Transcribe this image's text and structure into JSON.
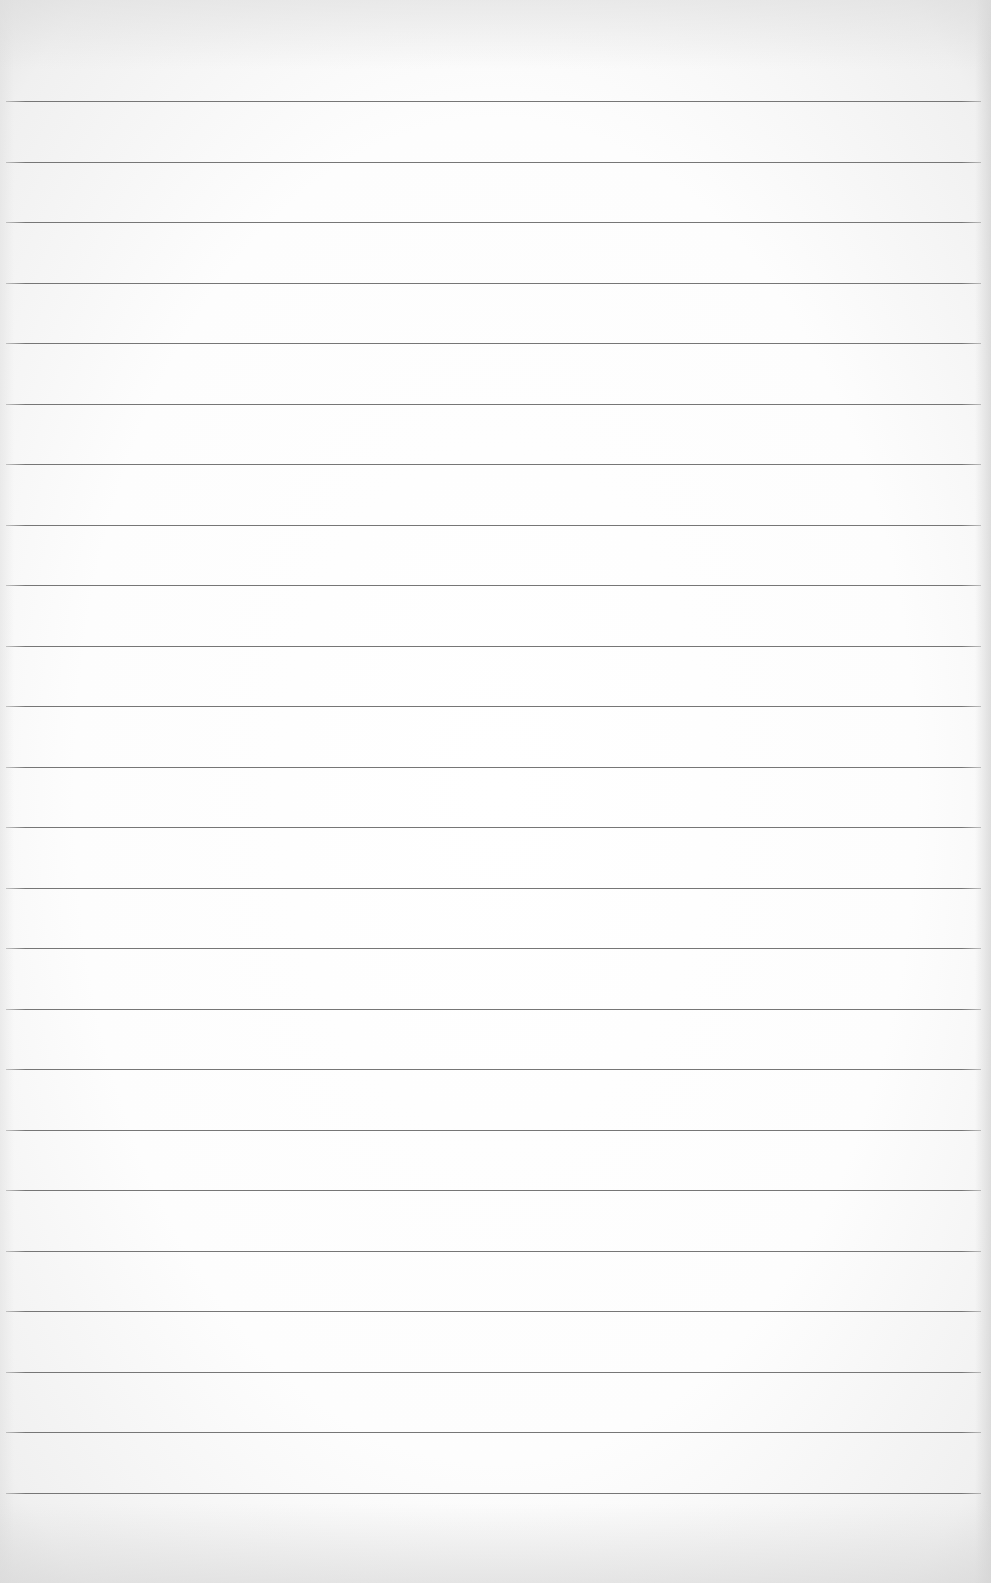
{
  "document": {
    "type": "blank ruled paper",
    "background_color": "#ffffff",
    "line_color": "#767676",
    "ruled_lines": {
      "count": 24,
      "first_y": 101,
      "spacing": 60.5
    },
    "text_content": ""
  }
}
